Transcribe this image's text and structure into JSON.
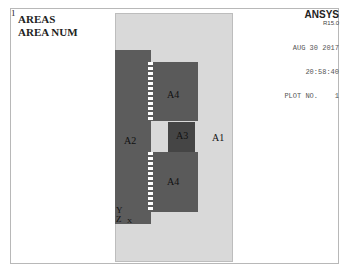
{
  "window": {
    "number": "1"
  },
  "plot": {
    "title_line1": "AREAS",
    "title_line2": "AREA NUM"
  },
  "brand": {
    "name": "ANSYS",
    "version": "R15.0"
  },
  "meta": {
    "date": "AUG 30 2017",
    "time": "20:58:40",
    "plot_no": "PLOT NO.    1"
  },
  "areas": [
    {
      "id": "A1",
      "label": "A1",
      "color": "#d9d9d9"
    },
    {
      "id": "A2",
      "label": "A2",
      "color": "#5c5c5c"
    },
    {
      "id": "A3",
      "label": "A3",
      "color": "#454545"
    },
    {
      "id": "A4_top",
      "label": "A4",
      "color": "#5a5a5a"
    },
    {
      "id": "A4_bottom",
      "label": "A4",
      "color": "#5a5a5a"
    }
  ],
  "triad": {
    "y": "Y",
    "z": "Z",
    "x": "X"
  }
}
